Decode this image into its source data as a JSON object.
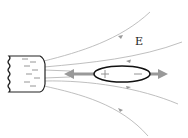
{
  "diagram": {
    "title": "",
    "field_label": "E",
    "elements": {
      "charged_body": {
        "description": "charged conductor with negative surface charges",
        "charge_sign": "-"
      },
      "dipole": {
        "description": "elongated object polarized in the field",
        "left_charge": "+",
        "right_charge": "-"
      },
      "force_arrows": {
        "description": "gray arrows pointing outward from both ends of dipole",
        "directions": [
          "left",
          "right"
        ]
      },
      "field_lines": {
        "count": 4,
        "direction": "toward the charged body"
      }
    },
    "colors": {
      "field_line": "#b8b8b8",
      "force_arrow": "#999999",
      "outline": "#222222"
    }
  }
}
